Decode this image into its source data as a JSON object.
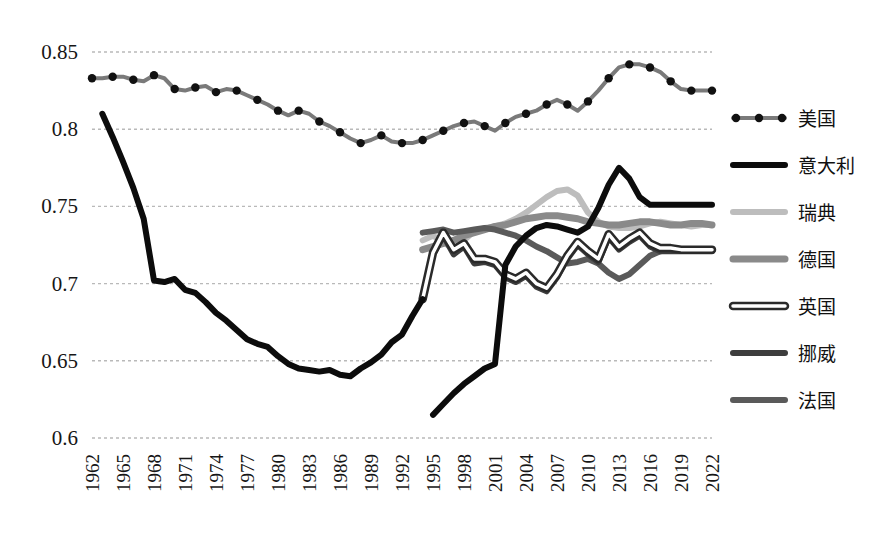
{
  "chart_data": {
    "type": "line",
    "title": "",
    "xlabel": "",
    "ylabel": "",
    "xlim": [
      1962,
      2022
    ],
    "ylim": [
      0.6,
      0.85
    ],
    "grid": true,
    "legend_position": "right",
    "ytick_labels": [
      "0.85",
      "0.8",
      "0.75",
      "0.7",
      "0.65",
      "0.6"
    ],
    "ytick_values": [
      0.85,
      0.8,
      0.75,
      0.7,
      0.65,
      0.6
    ],
    "xtick_labels": [
      "1962",
      "1965",
      "1968",
      "1971",
      "1974",
      "1977",
      "1980",
      "1983",
      "1986",
      "1989",
      "1992",
      "1995",
      "1998",
      "2001",
      "2004",
      "2007",
      "2010",
      "2013",
      "2016",
      "2019",
      "2022"
    ],
    "xtick_values": [
      1962,
      1965,
      1968,
      1971,
      1974,
      1977,
      1980,
      1983,
      1986,
      1989,
      1992,
      1995,
      1998,
      2001,
      2004,
      2007,
      2010,
      2013,
      2016,
      2019,
      2022
    ],
    "series": [
      {
        "name": "美国",
        "legend_label": "美国",
        "style": "line-with-markers",
        "color": "#7a7a7a",
        "marker_color": "#111111",
        "width": 4,
        "marker_every": 2,
        "x": [
          1962,
          1963,
          1964,
          1965,
          1966,
          1967,
          1968,
          1969,
          1970,
          1971,
          1972,
          1973,
          1974,
          1975,
          1976,
          1977,
          1978,
          1979,
          1980,
          1981,
          1982,
          1983,
          1984,
          1985,
          1986,
          1987,
          1988,
          1989,
          1990,
          1991,
          1992,
          1993,
          1994,
          1995,
          1996,
          1997,
          1998,
          1999,
          2000,
          2001,
          2002,
          2003,
          2004,
          2005,
          2006,
          2007,
          2008,
          2009,
          2010,
          2011,
          2012,
          2013,
          2014,
          2015,
          2016,
          2017,
          2018,
          2019,
          2020,
          2021,
          2022
        ],
        "y": [
          0.833,
          0.833,
          0.834,
          0.834,
          0.832,
          0.831,
          0.835,
          0.833,
          0.826,
          0.825,
          0.827,
          0.828,
          0.824,
          0.826,
          0.825,
          0.822,
          0.819,
          0.816,
          0.812,
          0.809,
          0.812,
          0.81,
          0.805,
          0.802,
          0.798,
          0.794,
          0.791,
          0.793,
          0.796,
          0.792,
          0.791,
          0.791,
          0.793,
          0.796,
          0.799,
          0.802,
          0.804,
          0.805,
          0.802,
          0.799,
          0.804,
          0.808,
          0.81,
          0.812,
          0.816,
          0.819,
          0.816,
          0.812,
          0.818,
          0.825,
          0.833,
          0.84,
          0.842,
          0.842,
          0.84,
          0.837,
          0.831,
          0.826,
          0.825,
          0.825,
          0.825
        ]
      },
      {
        "name": "意大利",
        "legend_label": "意大利",
        "style": "solid",
        "color": "#0c0c0c",
        "width": 6,
        "segments": [
          {
            "x": [
              1963,
              1964,
              1965,
              1966,
              1967,
              1968,
              1969,
              1970,
              1971,
              1972,
              1973,
              1974,
              1975,
              1976,
              1977,
              1978,
              1979,
              1980,
              1981,
              1982,
              1983,
              1984,
              1985,
              1986,
              1987,
              1988,
              1989,
              1990,
              1991,
              1992,
              1993,
              1994
            ],
            "y": [
              0.81,
              0.795,
              0.779,
              0.762,
              0.742,
              0.702,
              0.701,
              0.703,
              0.696,
              0.694,
              0.688,
              0.681,
              0.676,
              0.67,
              0.664,
              0.661,
              0.659,
              0.653,
              0.648,
              0.645,
              0.644,
              0.643,
              0.644,
              0.641,
              0.64,
              0.645,
              0.649,
              0.654,
              0.662,
              0.667,
              0.679,
              0.69
            ]
          },
          {
            "x": [
              1995,
              1996,
              1997,
              1998,
              1999,
              2000,
              2001,
              2002,
              2003,
              2004,
              2005,
              2006,
              2007,
              2008,
              2009,
              2010,
              2011,
              2012,
              2013,
              2014,
              2015,
              2016,
              2017,
              2018,
              2019,
              2020,
              2021,
              2022
            ],
            "y": [
              0.615,
              0.622,
              0.629,
              0.635,
              0.64,
              0.645,
              0.648,
              0.712,
              0.724,
              0.731,
              0.736,
              0.738,
              0.737,
              0.735,
              0.733,
              0.737,
              0.749,
              0.764,
              0.775,
              0.768,
              0.756,
              0.751,
              0.751,
              0.751,
              0.751,
              0.751,
              0.751,
              0.751
            ]
          }
        ]
      },
      {
        "name": "瑞典",
        "legend_label": "瑞典",
        "style": "solid",
        "color": "#bdbdbd",
        "width": 6,
        "x": [
          1994,
          1995,
          1996,
          1997,
          1998,
          1999,
          2000,
          2001,
          2002,
          2003,
          2004,
          2005,
          2006,
          2007,
          2008,
          2009,
          2010,
          2011,
          2012,
          2013,
          2014,
          2015,
          2016,
          2017,
          2018,
          2019,
          2020,
          2021,
          2022
        ],
        "y": [
          0.728,
          0.731,
          0.727,
          0.722,
          0.728,
          0.734,
          0.736,
          0.737,
          0.739,
          0.742,
          0.746,
          0.751,
          0.756,
          0.76,
          0.761,
          0.757,
          0.746,
          0.74,
          0.737,
          0.736,
          0.736,
          0.737,
          0.739,
          0.74,
          0.739,
          0.738,
          0.737,
          0.738,
          0.738
        ]
      },
      {
        "name": "德国",
        "legend_label": "德国",
        "style": "solid",
        "color": "#8a8a8a",
        "width": 7,
        "x": [
          1994,
          1995,
          1996,
          1997,
          1998,
          1999,
          2000,
          2001,
          2002,
          2003,
          2004,
          2005,
          2006,
          2007,
          2008,
          2009,
          2010,
          2011,
          2012,
          2013,
          2014,
          2015,
          2016,
          2017,
          2018,
          2019,
          2020,
          2021,
          2022
        ],
        "y": [
          0.722,
          0.724,
          0.726,
          0.728,
          0.731,
          0.733,
          0.735,
          0.737,
          0.738,
          0.74,
          0.742,
          0.743,
          0.744,
          0.744,
          0.743,
          0.742,
          0.74,
          0.739,
          0.738,
          0.738,
          0.739,
          0.74,
          0.74,
          0.739,
          0.738,
          0.738,
          0.739,
          0.739,
          0.738
        ]
      },
      {
        "name": "英国",
        "legend_label": "英国",
        "style": "outlined",
        "color": "#ffffff",
        "outline_color": "#2a2a2a",
        "width": 6,
        "x": [
          1994,
          1995,
          1996,
          1997,
          1998,
          1999,
          2000,
          2001,
          2002,
          2003,
          2004,
          2005,
          2006,
          2007,
          2008,
          2009,
          2010,
          2011,
          2012,
          2013,
          2014,
          2015,
          2016,
          2017,
          2018,
          2019,
          2020,
          2021,
          2022
        ],
        "y": [
          0.69,
          0.72,
          0.733,
          0.722,
          0.726,
          0.716,
          0.716,
          0.714,
          0.706,
          0.703,
          0.707,
          0.7,
          0.697,
          0.706,
          0.718,
          0.727,
          0.721,
          0.716,
          0.732,
          0.724,
          0.729,
          0.733,
          0.726,
          0.723,
          0.723,
          0.722,
          0.722,
          0.722,
          0.722
        ]
      },
      {
        "name": "挪威",
        "legend_label": "挪威",
        "style": "solid",
        "color": "#3d3d3d",
        "width": 6,
        "x": [
          1994,
          1995,
          1996,
          1997,
          1998,
          1999,
          2000,
          2001,
          2002,
          2003,
          2004,
          2005,
          2006,
          2007,
          2008,
          2009,
          2010,
          2011,
          2012,
          2013,
          2014,
          2015,
          2016,
          2017,
          2018,
          2019,
          2020,
          2021,
          2022
        ],
        "y": [
          0.69,
          0.719,
          0.731,
          0.719,
          0.724,
          0.713,
          0.714,
          0.712,
          0.704,
          0.701,
          0.705,
          0.698,
          0.695,
          0.704,
          0.716,
          0.725,
          0.719,
          0.714,
          0.73,
          0.722,
          0.727,
          0.731,
          0.724,
          0.721,
          0.721,
          0.721,
          0.721,
          0.721,
          0.721
        ]
      },
      {
        "name": "法国",
        "legend_label": "法国",
        "style": "solid",
        "color": "#5a5a5a",
        "width": 6,
        "x": [
          1994,
          1995,
          1996,
          1997,
          1998,
          1999,
          2000,
          2001,
          2002,
          2003,
          2004,
          2005,
          2006,
          2007,
          2008,
          2009,
          2010,
          2011,
          2012,
          2013,
          2014,
          2015,
          2016,
          2017,
          2018,
          2019,
          2020,
          2021,
          2022
        ],
        "y": [
          0.733,
          0.734,
          0.735,
          0.733,
          0.734,
          0.735,
          0.736,
          0.735,
          0.733,
          0.731,
          0.728,
          0.724,
          0.721,
          0.717,
          0.713,
          0.714,
          0.716,
          0.713,
          0.707,
          0.703,
          0.706,
          0.712,
          0.718,
          0.721,
          0.722,
          0.722,
          0.722,
          0.722,
          0.722
        ]
      }
    ]
  },
  "legend": {
    "entries": [
      {
        "label": "美国"
      },
      {
        "label": "意大利"
      },
      {
        "label": "瑞典"
      },
      {
        "label": "德国"
      },
      {
        "label": "英国"
      },
      {
        "label": "挪威"
      },
      {
        "label": "法国"
      }
    ]
  }
}
